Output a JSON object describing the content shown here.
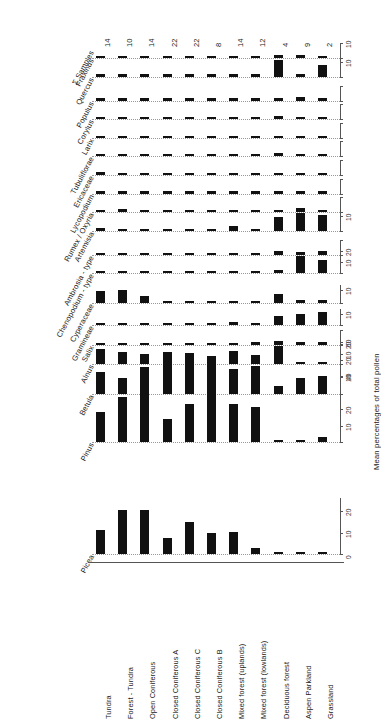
{
  "figure": {
    "type": "pollen-percentage-diagram",
    "axis_title": "Mean percentages of total pollen",
    "samples_header": "Σ Samples",
    "bar_color": "#111111",
    "grid_color": "#999999",
    "axis_color": "#555555"
  },
  "zones": [
    {
      "label": "Tundra",
      "samples": "14"
    },
    {
      "label": "Forest - Tundra",
      "samples": "10"
    },
    {
      "label": "Open Coniferous",
      "samples": "14"
    },
    {
      "label": "Closed Coniferous A",
      "samples": "22"
    },
    {
      "label": "Closed Coniferous C",
      "samples": "22"
    },
    {
      "label": "Closed Coniferous B",
      "samples": "8"
    },
    {
      "label": "Mixed forest (uplands)",
      "samples": "14"
    },
    {
      "label": "Mixed forest (lowlands)",
      "samples": "12"
    },
    {
      "label": "Deciduous forest",
      "samples": "4"
    },
    {
      "label": "Aspen Parkland",
      "samples": "9"
    },
    {
      "label": "Grassland",
      "samples": "2"
    }
  ],
  "chart_data": {
    "type": "bar",
    "title": "",
    "xlabel": "",
    "ylabel": "Mean percentages of total pollen",
    "grid": true,
    "legend": "none",
    "categories": [
      "Tundra",
      "Forest - Tundra",
      "Open Coniferous",
      "Closed Coniferous A",
      "Closed Coniferous C",
      "Closed Coniferous B",
      "Mixed forest (uplands)",
      "Mixed forest (lowlands)",
      "Deciduous forest",
      "Aspen Parkland",
      "Grassland"
    ],
    "series": [
      {
        "name": "Fraxinus",
        "ylim": [
          0,
          10
        ],
        "ticks": [
          0,
          10
        ],
        "tick_labels": [
          "",
          "10"
        ],
        "values": [
          0.1,
          0.4,
          0.5,
          0.5,
          0.4,
          0.4,
          0.8,
          0.6,
          2.2,
          1.7,
          1.3
        ]
      },
      {
        "name": "Quercus",
        "ylim": [
          0,
          14
        ],
        "ticks": [
          0,
          10
        ],
        "tick_labels": [
          "",
          "10"
        ],
        "values": [
          0.1,
          0.1,
          0.6,
          0.8,
          0.7,
          0.9,
          1.1,
          0.8,
          11.5,
          0.4,
          8.0
        ]
      },
      {
        "name": "Populus",
        "ylim": [
          0,
          10
        ],
        "ticks": [
          0,
          10
        ],
        "tick_labels": [
          "",
          ""
        ],
        "values": [
          0.3,
          0.5,
          0.5,
          0.5,
          0.5,
          0.6,
          0.9,
          0.9,
          1.8,
          2.4,
          1.4
        ]
      },
      {
        "name": "Corylus",
        "ylim": [
          0,
          10
        ],
        "ticks": [
          0,
          10
        ],
        "tick_labels": [
          "",
          ""
        ],
        "values": [
          0.3,
          0.2,
          0.3,
          0.4,
          0.4,
          0.4,
          1.5,
          0.4,
          2.3,
          0.1,
          0.2
        ]
      },
      {
        "name": "Larix",
        "ylim": [
          0,
          10
        ],
        "ticks": [
          0,
          10
        ],
        "tick_labels": [
          "",
          ""
        ],
        "values": [
          0.3,
          0.3,
          0.3,
          0.4,
          0.4,
          1.2,
          0.4,
          1.0,
          0.1,
          0.1,
          0.1
        ]
      },
      {
        "name": "Tubuliflorae",
        "ylim": [
          0,
          10
        ],
        "ticks": [
          0,
          10
        ],
        "tick_labels": [
          "",
          ""
        ],
        "values": [
          0.4,
          0.5,
          0.4,
          0.4,
          0.4,
          0.4,
          0.6,
          0.6,
          2.1,
          0.8,
          1.9
        ]
      },
      {
        "name": "Ericaceae",
        "ylim": [
          0,
          10
        ],
        "ticks": [
          0,
          10
        ],
        "tick_labels": [
          "",
          ""
        ],
        "values": [
          2.0,
          0.8,
          0.6,
          0.3,
          0.2,
          0.2,
          0.2,
          0.2,
          0.1,
          0.1,
          0.1
        ]
      },
      {
        "name": "Lycopodium",
        "ylim": [
          0,
          10
        ],
        "ticks": [
          0,
          10
        ],
        "tick_labels": [
          "",
          ""
        ],
        "values": [
          1.3,
          0.7,
          0.7,
          0.4,
          0.3,
          0.3,
          0.3,
          0.3,
          0.2,
          0.1,
          0.1
        ]
      },
      {
        "name": "Rumex / Oxyria",
        "ylim": [
          0,
          10
        ],
        "ticks": [
          0,
          10
        ],
        "tick_labels": [
          "",
          ""
        ],
        "values": [
          1.0,
          2.2,
          1.0,
          0.4,
          0.3,
          0.3,
          0.3,
          0.3,
          0.8,
          3.0,
          0.8
        ]
      },
      {
        "name": "Artemisia",
        "ylim": [
          0,
          14
        ],
        "ticks": [
          0,
          10
        ],
        "tick_labels": [
          "",
          "10"
        ],
        "values": [
          1.7,
          1.0,
          0.9,
          1.1,
          1.4,
          0.9,
          3.0,
          0.9,
          9.5,
          12.0,
          10.5
        ]
      },
      {
        "name": "Ambrosia - type",
        "ylim": [
          0,
          10
        ],
        "ticks": [
          0,
          10
        ],
        "tick_labels": [
          "",
          ""
        ],
        "values": [
          0.7,
          1.0,
          0.6,
          0.7,
          0.6,
          0.6,
          0.7,
          0.7,
          2.2,
          2.0,
          2.2
        ]
      },
      {
        "name": "Chenopodium - type",
        "ylim": [
          0,
          24
        ],
        "ticks": [
          0,
          10,
          20
        ],
        "tick_labels": [
          "",
          "10",
          "20"
        ],
        "values": [
          0.6,
          0.6,
          0.5,
          0.7,
          0.6,
          0.6,
          0.7,
          1.4,
          3.5,
          16.0,
          12.0
        ]
      },
      {
        "name": "Cyperaceae",
        "ylim": [
          0,
          14
        ],
        "ticks": [
          0,
          10
        ],
        "tick_labels": [
          "",
          "10"
        ],
        "values": [
          9.5,
          10.5,
          5.5,
          1.6,
          1.0,
          0.9,
          1.0,
          1.2,
          7.0,
          2.8,
          2.5
        ]
      },
      {
        "name": "Gramineae",
        "ylim": [
          0,
          14
        ],
        "ticks": [
          0,
          10
        ],
        "tick_labels": [
          "",
          "10"
        ],
        "values": [
          1.2,
          1.2,
          1.1,
          2.3,
          1.2,
          1.1,
          2.5,
          1.2,
          8.0,
          10.0,
          11.5
        ]
      },
      {
        "name": "Salix",
        "ylim": [
          0,
          10
        ],
        "ticks": [
          0,
          10
        ],
        "tick_labels": [
          "",
          ""
        ],
        "values": [
          1.0,
          1.2,
          1.0,
          0.8,
          1.2,
          1.3,
          1.8,
          1.9,
          2.6,
          2.4,
          2.0
        ]
      },
      {
        "name": "Alnus",
        "ylim": [
          0,
          26
        ],
        "ticks": [
          0,
          10,
          20
        ],
        "tick_labels": [
          "",
          "10",
          "20"
        ],
        "values": [
          15.0,
          12.0,
          10.5,
          5.0,
          11.0,
          8.0,
          13.5,
          9.0,
          18.0,
          1.5,
          1.4
        ]
      },
      {
        "name": "Betula",
        "ylim": [
          0,
          26
        ],
        "ticks": [
          0,
          10,
          20
        ],
        "tick_labels": [
          "",
          "10",
          "20"
        ],
        "values": [
          13.0,
          9.5,
          16.0,
          25.0,
          20.0,
          18.5,
          15.0,
          16.5,
          5.0,
          9.5,
          11.0
        ]
      },
      {
        "name": "Pinus",
        "ylim": [
          0,
          65
        ],
        "ticks": [
          0,
          10,
          20,
          40,
          60
        ],
        "tick_labels": [
          "",
          "10",
          "20",
          "40",
          "60"
        ],
        "values": [
          18.0,
          27.0,
          30.0,
          14.0,
          23.0,
          33.0,
          23.0,
          21.0,
          1.5,
          1.5,
          3.0
        ]
      },
      {
        "name": "Picea",
        "ylim": [
          0,
          26
        ],
        "ticks": [
          0,
          10,
          20
        ],
        "tick_labels": [
          "0",
          "10",
          "20"
        ],
        "values": [
          11.0,
          20.5,
          20.5,
          7.5,
          15.0,
          10.0,
          10.5,
          3.0,
          0.4,
          0.3,
          0.3
        ]
      }
    ]
  }
}
